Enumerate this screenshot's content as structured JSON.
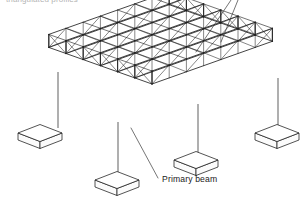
{
  "figure": {
    "kind": "isometric-line-drawing",
    "background_color": "#ffffff",
    "line_color": "#1b1b1b"
  },
  "top_caption": {
    "text": "triangulated profiles",
    "note": "clipped at the top edge of the image, only the lower pixel sliver of the letters is visible",
    "color": "#9a9a9a"
  },
  "labels": [
    {
      "id": "primary-beam",
      "text": "Primary beam",
      "x": 162,
      "y": 182,
      "leader_from": [
        158,
        178
      ],
      "leader_to": [
        131,
        128
      ]
    }
  ],
  "leaders_top_right": [
    {
      "id": "leader-a",
      "from": [
        196,
        52
      ],
      "to": [
        231,
        0
      ]
    },
    {
      "id": "leader-b",
      "from": [
        221,
        42
      ],
      "to": [
        238,
        0
      ]
    }
  ],
  "geometry": {
    "iso": {
      "origin_x": 152,
      "origin_y": 84,
      "axis_u_dx": 17.2,
      "axis_u_dy": -6.1,
      "axis_v_dx": -17.2,
      "axis_v_dy": -6.1,
      "bays_u": 7,
      "bays_v": 6
    },
    "truss_depth_px": 13,
    "truss_count": 6,
    "panel_divisions": 7
  },
  "columns": [
    {
      "id": "column-left",
      "top": [
        58,
        72
      ],
      "bottom": [
        58,
        128
      ]
    },
    {
      "id": "column-front-left",
      "top": [
        118,
        122
      ],
      "bottom": [
        118,
        175
      ]
    },
    {
      "id": "column-front-right",
      "top": [
        198,
        104
      ],
      "bottom": [
        198,
        155
      ]
    },
    {
      "id": "column-right",
      "top": [
        278,
        78
      ],
      "bottom": [
        278,
        128
      ]
    }
  ],
  "footings": [
    {
      "id": "footing-left",
      "cx": 40,
      "cy": 133
    },
    {
      "id": "footing-front-left",
      "cx": 117,
      "cy": 180
    },
    {
      "id": "footing-front-right",
      "cx": 196,
      "cy": 160
    },
    {
      "id": "footing-right",
      "cx": 277,
      "cy": 133
    }
  ],
  "footing_shape": {
    "half_width": 22,
    "half_depth": 8.5,
    "thickness": 7
  }
}
